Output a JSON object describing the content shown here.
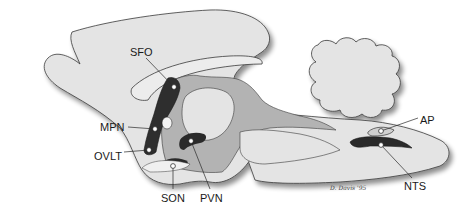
{
  "diagram": {
    "colors": {
      "brain_fill": "#e4e4e4",
      "ventricle_fill": "#b3b3b3",
      "outline": "#3a3a3a",
      "nucleus_dark": "#2a2a2a",
      "marker": "#ffffff",
      "shadow": "#9a9a9a"
    },
    "labels": [
      {
        "id": "sfo",
        "text": "SFO",
        "full": "subfornical organ",
        "x": 130,
        "y": 50,
        "point": [
          174,
          87
        ]
      },
      {
        "id": "mpn",
        "text": "MPN",
        "full": "median preoptic nucleus",
        "x": 103,
        "y": 130,
        "point": [
          155,
          129
        ]
      },
      {
        "id": "ovlt",
        "text": "OVLT",
        "full": "organum vasculosum of the lamina terminalis",
        "x": 99,
        "y": 158,
        "point": [
          149,
          150
        ]
      },
      {
        "id": "son",
        "text": "SON",
        "full": "supraoptic nucleus",
        "x": 162,
        "y": 200,
        "point": [
          173,
          166
        ]
      },
      {
        "id": "pvn",
        "text": "PVN",
        "full": "paraventricular nucleus",
        "x": 200,
        "y": 200,
        "point": [
          191,
          141
        ]
      },
      {
        "id": "ap",
        "text": "AP",
        "full": "area postrema",
        "x": 421,
        "y": 122,
        "point": [
          381,
          131
        ]
      },
      {
        "id": "nts",
        "text": "NTS",
        "full": "nucleus of the solitary tract",
        "x": 404,
        "y": 188,
        "point": [
          381,
          145
        ]
      }
    ],
    "signature": "D. Davis '95"
  }
}
